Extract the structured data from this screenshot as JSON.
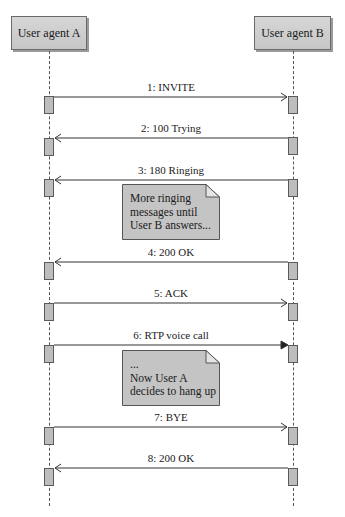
{
  "diagram": {
    "type": "sequence",
    "actors": [
      {
        "id": "A",
        "label": "User agent A"
      },
      {
        "id": "B",
        "label": "User agent B"
      }
    ],
    "messages": [
      {
        "label": "1: INVITE",
        "from": "A",
        "to": "B",
        "arrow": "open"
      },
      {
        "label": "2: 100 Trying",
        "from": "B",
        "to": "A",
        "arrow": "open"
      },
      {
        "label": "3: 180 Ringing",
        "from": "B",
        "to": "A",
        "arrow": "open"
      },
      {
        "label": "4: 200 OK",
        "from": "B",
        "to": "A",
        "arrow": "open"
      },
      {
        "label": "5: ACK",
        "from": "A",
        "to": "B",
        "arrow": "open"
      },
      {
        "label": "6: RTP voice call",
        "from": "A",
        "to": "B",
        "arrow": "filled"
      },
      {
        "label": "7: BYE",
        "from": "A",
        "to": "B",
        "arrow": "open"
      },
      {
        "label": "8: 200 OK",
        "from": "B",
        "to": "A",
        "arrow": "open"
      }
    ],
    "notes": [
      {
        "after_message": 3,
        "lines": [
          "More ringing",
          "messages until",
          "User B answers..."
        ]
      },
      {
        "after_message": 6,
        "lines": [
          "...",
          "Now User A",
          "decides to hang up"
        ]
      }
    ]
  }
}
